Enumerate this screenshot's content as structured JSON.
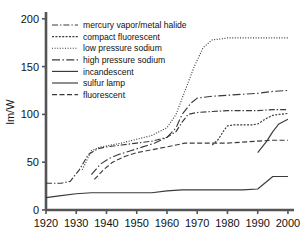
{
  "chart_data": {
    "type": "line",
    "title": "",
    "xlabel": "",
    "ylabel": "lm/W",
    "xlim": [
      1920,
      2002
    ],
    "ylim": [
      0,
      205
    ],
    "xticks": [
      1920,
      1930,
      1940,
      1950,
      1960,
      1970,
      1980,
      1990,
      2000
    ],
    "yticks": [
      0,
      50,
      100,
      150,
      200
    ],
    "grid": false,
    "legend_position": "top-left",
    "series": [
      {
        "name": "mercury vapor/metal halide",
        "style": "dash-dot",
        "x": [
          1920,
          1925,
          1928,
          1931,
          1934,
          1937,
          1940,
          1945,
          1950,
          1955,
          1960,
          1963,
          1965,
          1967,
          1970,
          1975,
          1980,
          1985,
          1990,
          1995,
          2000
        ],
        "y": [
          28,
          28,
          30,
          42,
          58,
          64,
          66,
          68,
          70,
          72,
          76,
          82,
          92,
          100,
          102,
          103,
          104,
          104,
          104,
          105,
          105
        ]
      },
      {
        "name": "compact fluorescent",
        "style": "fine-dash",
        "x": [
          1975,
          1977,
          1979,
          1980,
          1982,
          1985,
          1988,
          1990,
          1993,
          1995,
          1997,
          2000
        ],
        "y": [
          68,
          74,
          84,
          88,
          89,
          89,
          89,
          90,
          96,
          99,
          100,
          101
        ]
      },
      {
        "name": "low pressure sodium",
        "style": "dotted",
        "x": [
          1932,
          1935,
          1938,
          1940,
          1945,
          1950,
          1955,
          1960,
          1963,
          1966,
          1969,
          1972,
          1975,
          1978,
          1980,
          1985,
          1990,
          1995,
          2000
        ],
        "y": [
          42,
          62,
          66,
          67,
          70,
          74,
          78,
          86,
          100,
          125,
          150,
          170,
          178,
          179,
          180,
          180,
          180,
          180,
          180
        ]
      },
      {
        "name": "high pressure sodium",
        "style": "dash-dot-long",
        "x": [
          1935,
          1938,
          1941,
          1944,
          1948,
          1952,
          1956,
          1960,
          1963,
          1965,
          1968,
          1970,
          1975,
          1980,
          1985,
          1990,
          1995,
          2000
        ],
        "y": [
          37,
          48,
          54,
          58,
          62,
          66,
          70,
          76,
          86,
          100,
          112,
          117,
          119,
          120,
          121,
          122,
          124,
          125
        ]
      },
      {
        "name": "incandescent",
        "style": "solid",
        "x": [
          1920,
          1925,
          1930,
          1935,
          1940,
          1945,
          1950,
          1955,
          1960,
          1965,
          1970,
          1975,
          1980,
          1985,
          1990,
          1995,
          2000
        ],
        "y": [
          13,
          15,
          17,
          18,
          18,
          18,
          18,
          18,
          20,
          21,
          21,
          21,
          21,
          21,
          22,
          35,
          35
        ]
      },
      {
        "name": "sulfur lamp",
        "style": "solid",
        "x": [
          1990,
          1993,
          1995,
          1997,
          2000
        ],
        "y": [
          60,
          72,
          82,
          90,
          95
        ]
      },
      {
        "name": "fluorescent",
        "style": "dashed",
        "x": [
          1936,
          1939,
          1942,
          1946,
          1950,
          1955,
          1960,
          1963,
          1966,
          1969,
          1972,
          1975,
          1980,
          1985,
          1990,
          1995,
          2000
        ],
        "y": [
          32,
          42,
          50,
          56,
          60,
          63,
          66,
          68,
          70,
          70,
          70,
          70,
          70,
          71,
          72,
          73,
          73
        ]
      }
    ]
  },
  "legend": {
    "entries": [
      {
        "label": "mercury vapor/metal halide",
        "style": "dash-dot"
      },
      {
        "label": "compact fluorescent",
        "style": "fine-dash"
      },
      {
        "label": "low pressure sodium",
        "style": "dotted"
      },
      {
        "label": "high pressure sodium",
        "style": "dash-dot-long"
      },
      {
        "label": "incandescent",
        "style": "solid"
      },
      {
        "label": "sulfur lamp",
        "style": "solid"
      },
      {
        "label": "fluorescent",
        "style": "dashed"
      }
    ]
  },
  "axes": {
    "y_title": "lm/W",
    "y_ticks": [
      "0",
      "50",
      "100",
      "150",
      "200"
    ],
    "x_ticks": [
      "1920",
      "1930",
      "1940",
      "1950",
      "1960",
      "1970",
      "1980",
      "1990",
      "2000"
    ]
  },
  "colors": {
    "line": "#3a3a3a",
    "axis": "#555555",
    "text": "#111111",
    "background": "#ffffff"
  }
}
